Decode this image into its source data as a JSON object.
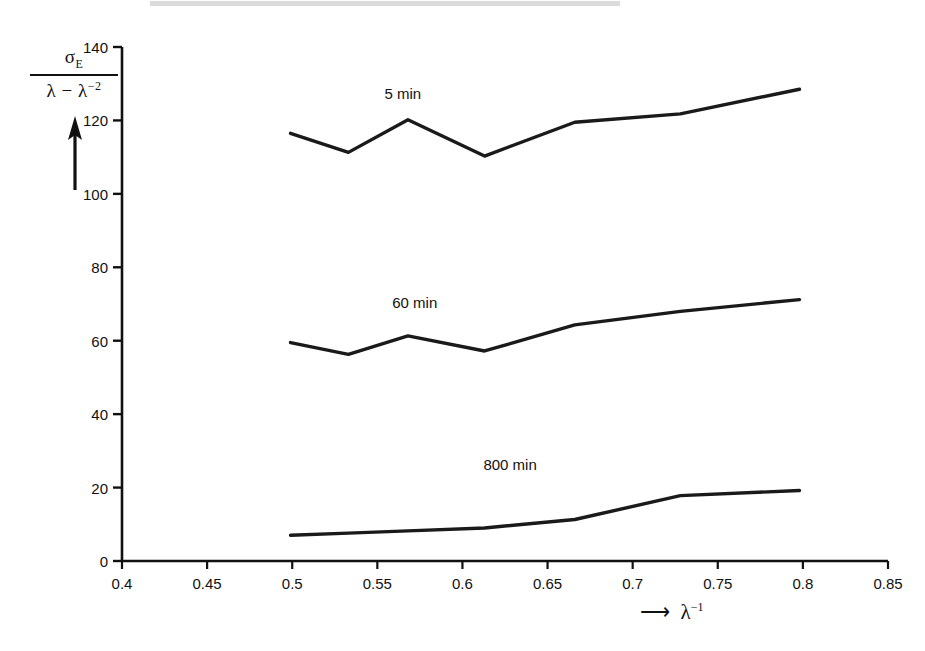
{
  "figure": {
    "background_color": "#ffffff",
    "line_color": "#1a1a1a",
    "axis_color": "#111111"
  },
  "axes": {
    "y_label_numerator": "σ",
    "y_label_numerator_sub": "E",
    "y_label_denominator_a": "λ − λ",
    "y_label_denominator_sup": "−2",
    "x_label": "λ",
    "x_label_sup": "−1",
    "x_arrow": "⟶"
  },
  "chart_data": {
    "type": "line",
    "title": "",
    "xlabel": "λ⁻¹",
    "ylabel": "σ_E / (λ − λ⁻²)",
    "xlim": [
      0.4,
      0.85
    ],
    "ylim": [
      0,
      140
    ],
    "xticks": [
      0.4,
      0.45,
      0.5,
      0.55,
      0.6,
      0.65,
      0.7,
      0.75,
      0.8,
      0.85
    ],
    "xtick_labels": [
      "0.4",
      "0.45",
      "0.5",
      "0.55",
      "0.6",
      "0.65",
      "0.7",
      "0.75",
      "0.8",
      "0.85"
    ],
    "yticks": [
      0,
      20,
      40,
      60,
      80,
      100,
      120,
      140
    ],
    "ytick_labels": [
      "0",
      "20",
      "40",
      "60",
      "80",
      "100",
      "120",
      "140"
    ],
    "grid": false,
    "legend": "inline-annotations",
    "series": [
      {
        "name": "5 min",
        "label": "5 min",
        "label_x": 0.565,
        "label_y": 127,
        "x": [
          0.499,
          0.533,
          0.568,
          0.613,
          0.666,
          0.728,
          0.798
        ],
        "y": [
          116.5,
          111.3,
          120.2,
          110.3,
          119.5,
          121.8,
          128.5
        ]
      },
      {
        "name": "60 min",
        "label": "60 min",
        "label_x": 0.572,
        "label_y": 70,
        "x": [
          0.499,
          0.533,
          0.568,
          0.613,
          0.666,
          0.728,
          0.798
        ],
        "y": [
          59.5,
          56.3,
          61.3,
          57.2,
          64.3,
          68.0,
          71.2
        ]
      },
      {
        "name": "800 min",
        "label": "800 min",
        "label_x": 0.628,
        "label_y": 26,
        "x": [
          0.499,
          0.533,
          0.568,
          0.613,
          0.666,
          0.728,
          0.798
        ],
        "y": [
          7.0,
          7.6,
          8.2,
          9.0,
          11.3,
          17.8,
          19.2
        ]
      }
    ]
  }
}
